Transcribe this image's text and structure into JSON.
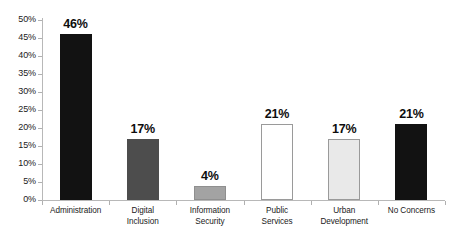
{
  "chart_data": {
    "type": "bar",
    "title": "",
    "subtitle": "",
    "xlabel": "",
    "ylabel": "",
    "ylim": [
      0,
      50
    ],
    "y_tick_step": 5,
    "grid": false,
    "legend": "none",
    "value_label_suffix": "%",
    "categories": [
      "Administration",
      "Digital Inclusion",
      "Information Security",
      "Public Services",
      "Urban Development",
      "No Concerns"
    ],
    "category_lines": [
      [
        "Administration"
      ],
      [
        "Digital",
        "Inclusion"
      ],
      [
        "Information",
        "Security"
      ],
      [
        "Public",
        "Services"
      ],
      [
        "Urban",
        "Development"
      ],
      [
        "No Concerns"
      ]
    ],
    "values": [
      46,
      17,
      4,
      21,
      17,
      21
    ],
    "value_labels": [
      "46%",
      "17%",
      "4%",
      "21%",
      "17%",
      "21%"
    ],
    "bar_fills": [
      "#121212",
      "#4d4d4d",
      "#a3a3a3",
      "#ffffff",
      "#e9e9e9",
      "#121212"
    ],
    "bar_strokes": [
      "#121212",
      "#4d4d4d",
      "#8f8f8f",
      "#9a9a9a",
      "#9a9a9a",
      "#121212"
    ],
    "y_tick_labels": [
      "50%",
      "45%",
      "40%",
      "35%",
      "30%",
      "25%",
      "20%",
      "15%",
      "10%",
      "5%",
      "0%"
    ],
    "y_tick_values": [
      50,
      45,
      40,
      35,
      30,
      25,
      20,
      15,
      10,
      5,
      0
    ]
  },
  "axis": {
    "line_color": "#b8b8b8",
    "tick_color": "#b0b0b0",
    "text_color": "#1a1a1a"
  }
}
